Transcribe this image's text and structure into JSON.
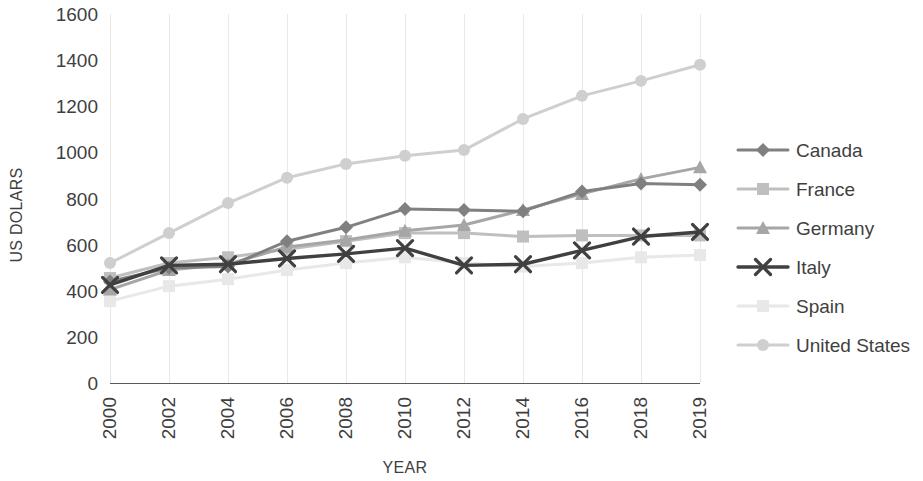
{
  "chart_data": {
    "type": "line",
    "title": "",
    "xlabel": "YEAR",
    "ylabel": "US DOLARS",
    "categories": [
      "2000",
      "2002",
      "2004",
      "2006",
      "2008",
      "2010",
      "2012",
      "2014",
      "2016",
      "2018",
      "2019"
    ],
    "yticks": [
      0,
      200,
      400,
      600,
      800,
      1000,
      1200,
      1400,
      1600
    ],
    "ylim": [
      0,
      1600
    ],
    "grid": "vertical",
    "legend_position": "right",
    "series": [
      {
        "name": "Canada",
        "marker": "diamond",
        "color": "#808080",
        "values": [
          440,
          500,
          505,
          615,
          675,
          755,
          750,
          745,
          830,
          865,
          860
        ]
      },
      {
        "name": "France",
        "marker": "square",
        "color": "#bfbfbf",
        "values": [
          455,
          520,
          545,
          580,
          615,
          650,
          650,
          635,
          640,
          640,
          640
        ]
      },
      {
        "name": "Germany",
        "marker": "triangle",
        "color": "#a6a6a6",
        "values": [
          405,
          490,
          515,
          590,
          620,
          660,
          685,
          750,
          820,
          885,
          935
        ]
      },
      {
        "name": "Italy",
        "marker": "x",
        "color": "#404040",
        "values": [
          425,
          510,
          515,
          540,
          560,
          585,
          510,
          515,
          575,
          635,
          655
        ]
      },
      {
        "name": "Spain",
        "marker": "square",
        "color": "#e8e8e8",
        "values": [
          355,
          420,
          450,
          490,
          520,
          545,
          520,
          505,
          520,
          545,
          555
        ]
      },
      {
        "name": "United States",
        "marker": "circle",
        "color": "#cfcfcf",
        "values": [
          520,
          650,
          780,
          890,
          950,
          985,
          1010,
          1145,
          1245,
          1310,
          1380
        ]
      }
    ]
  },
  "legend": {
    "items": [
      {
        "label": "Canada"
      },
      {
        "label": "France"
      },
      {
        "label": "Germany"
      },
      {
        "label": "Italy"
      },
      {
        "label": "Spain"
      },
      {
        "label": "United States"
      }
    ]
  },
  "axes": {
    "y_title": "US DOLARS",
    "x_title": "YEAR",
    "y_tick_labels": [
      "1600",
      "1400",
      "1200",
      "1000",
      "800",
      "600",
      "400",
      "200",
      "0"
    ],
    "x_tick_labels": [
      "2000",
      "2002",
      "2004",
      "2006",
      "2008",
      "2010",
      "2012",
      "2014",
      "2016",
      "2018",
      "2019"
    ]
  },
  "colors": {
    "grid": "#e9e9e9",
    "axis": "#5a5a5a",
    "text": "#3f3f3f",
    "background": "#ffffff"
  }
}
